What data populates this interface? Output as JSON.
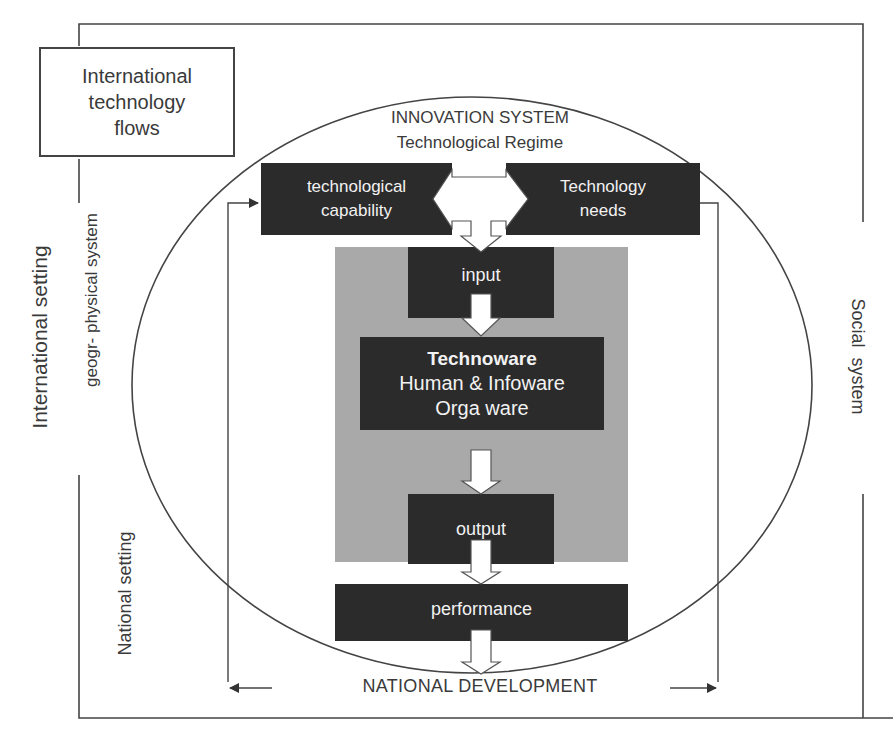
{
  "diagram": {
    "international_box": {
      "lines": [
        "International",
        "technology",
        "flows"
      ]
    },
    "innovation_system": {
      "title": "INNOVATION SYSTEM",
      "subtitle": "Technological Regime"
    },
    "top_boxes": {
      "capability": {
        "lines": [
          "technological",
          "capability"
        ]
      },
      "needs": {
        "lines": [
          "Technology",
          "needs"
        ]
      }
    },
    "process": {
      "input": "input",
      "core": {
        "bold": "Technoware",
        "lines": [
          "Human & Infoware",
          "Orga ware"
        ]
      },
      "output": "output",
      "performance": "performance"
    },
    "bottom_label": "NATIONAL DEVELOPMENT",
    "side_labels": {
      "international_setting": "International setting",
      "geo_physical_system": "geogr- physical system",
      "national_setting": "National setting",
      "social_system": "Social  system"
    },
    "colors": {
      "dark_box": "#2b2b2b",
      "gray_panel": "#a9a9a9",
      "line": "#444444",
      "text": "#3a3a3a",
      "box_text": "#f2f2f2"
    }
  }
}
